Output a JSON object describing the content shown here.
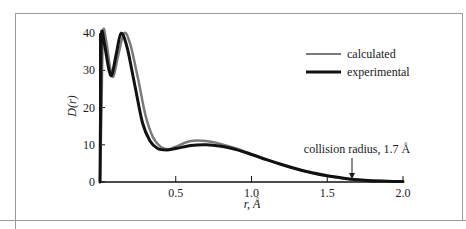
{
  "chart_data": {
    "type": "line",
    "title": "",
    "xlabel": "r, Å",
    "ylabel": "D(r)",
    "xlim": [
      0,
      2.0
    ],
    "ylim": [
      0,
      40
    ],
    "xticks": [
      0.5,
      1.0,
      1.5,
      2.0
    ],
    "xtick_labels": [
      "0.5",
      "1.0",
      "1.5",
      "2.0"
    ],
    "yticks": [
      0,
      10,
      20,
      30,
      40
    ],
    "ytick_labels": [
      "0",
      "10",
      "20",
      "30",
      "40"
    ],
    "grid": false,
    "legend_position": "upper right",
    "series": [
      {
        "name": "calculated",
        "color": "#7a7a7a",
        "x": [
          0.0,
          0.01,
          0.02,
          0.04,
          0.07,
          0.09,
          0.12,
          0.16,
          0.2,
          0.25,
          0.3,
          0.35,
          0.4,
          0.45,
          0.5,
          0.6,
          0.7,
          0.8,
          0.9,
          1.0,
          1.1,
          1.2,
          1.3,
          1.4,
          1.5,
          1.6,
          1.7,
          1.8,
          1.9,
          2.0
        ],
        "values": [
          0,
          20,
          40,
          38,
          30,
          28.5,
          34,
          40,
          37,
          28,
          18,
          12,
          9.5,
          8.8,
          9.5,
          11,
          11,
          10.2,
          9,
          7.5,
          6,
          4.6,
          3.4,
          2.4,
          1.6,
          1.0,
          0.6,
          0.4,
          0.2,
          0.1
        ]
      },
      {
        "name": "experimental",
        "color": "#111111",
        "x": [
          0.0,
          0.005,
          0.01,
          0.03,
          0.06,
          0.08,
          0.11,
          0.14,
          0.18,
          0.23,
          0.28,
          0.33,
          0.38,
          0.44,
          0.5,
          0.6,
          0.7,
          0.8,
          0.9,
          1.0,
          1.1,
          1.2,
          1.3,
          1.4,
          1.5,
          1.6,
          1.7,
          1.8,
          1.9,
          2.0
        ],
        "values": [
          0,
          25,
          40,
          37,
          30,
          29,
          35,
          40,
          36,
          26,
          16,
          11,
          9,
          8.6,
          9,
          9.8,
          10,
          9.6,
          8.7,
          7.4,
          6,
          4.7,
          3.5,
          2.5,
          1.7,
          1.1,
          0.6,
          0.3,
          0.2,
          0.1
        ]
      }
    ],
    "annotations": [
      {
        "text": "collision radius, 1.7 Å",
        "x": 1.7,
        "arrow": "down"
      }
    ]
  },
  "legend": {
    "items": [
      {
        "label": "calculated",
        "color": "#7a7a7a"
      },
      {
        "label": "experimental",
        "color": "#111111"
      }
    ]
  },
  "axes": {
    "xlabel": "r, Å",
    "ylabel": "D(r)"
  },
  "annotation": {
    "text": "collision radius, 1.7 Å"
  }
}
